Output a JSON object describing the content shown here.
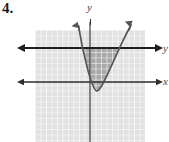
{
  "problem": {
    "number": "4."
  },
  "figure": {
    "name": "parabola-inequality-graph",
    "axis_labels": {
      "y_top": "y",
      "right_upper": "y",
      "right_lower": "x"
    },
    "colors": {
      "grid_background": "#e2e2e2",
      "grid_line": "#ffffff",
      "shaded_region": "#a9a9a9",
      "curve": "#555555",
      "axis": "#3c3c3c",
      "bold_line": "#1e1e1e",
      "label_text": "#3a3a3a"
    },
    "grid": {
      "left": 35,
      "top": 30,
      "right": 145,
      "bottom": 142,
      "cell_size": 5.5
    },
    "axes": {
      "x_axis_y": 82,
      "y_axis_x": 90,
      "x_axis_start": 20,
      "x_axis_end": 160
    },
    "boundary_line": {
      "type": "horizontal",
      "y": 48,
      "start": 20,
      "end": 160,
      "style": "solid-bold"
    },
    "parabola": {
      "orientation": "opens-up",
      "vertex": [
        97,
        91
      ],
      "left_arm_end": [
        78,
        20
      ],
      "right_arm_end": [
        131,
        20
      ],
      "style": "solid"
    },
    "shading": {
      "description": "region between parabola and horizontal boundary line",
      "fill": "#a9a9a9"
    }
  }
}
